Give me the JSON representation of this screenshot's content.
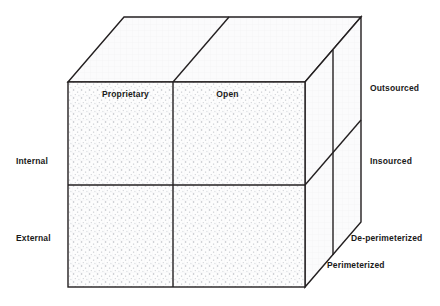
{
  "diagram": {
    "type": "3d-cube-model",
    "colors": {
      "stroke": "#231f20",
      "front_face_fill": "#fdfdfd",
      "top_face_fill": "#fbfbfb",
      "side_face_fill": "#fafafa",
      "stipple_dot": "#b9bcc2",
      "grid_line": "#ededf0",
      "label_text": "#1a1a1a",
      "page_background": "#ffffff"
    },
    "geometry": {
      "front_face": {
        "left": 68,
        "top": 82,
        "right": 305,
        "bottom": 287
      },
      "depth_offset": {
        "dx": 56,
        "dy": -65
      },
      "front_vertical_divider_x": 173,
      "front_horizontal_divider_y": 185,
      "side_vertical_divider_x": 333,
      "stroke_width": 1.4
    },
    "axes": {
      "x_axis": {
        "name": "technology-openness-axis",
        "labels": [
          "Proprietary",
          "Open"
        ]
      },
      "y_axis": {
        "name": "location-axis",
        "labels": [
          "Internal",
          "External"
        ]
      },
      "z_axis": {
        "name": "sourcing-and-perimeter-axis",
        "labels": [
          "Outsourced",
          "Insourced",
          "De-perimeterized",
          "Perimeterized"
        ]
      }
    },
    "faces": {
      "front": {
        "name": "front-face",
        "quadrants": [
          {
            "label": "Proprietary",
            "row": "Internal"
          },
          {
            "label": "Open",
            "row": "Internal"
          },
          {
            "label": "Proprietary",
            "row": "External"
          },
          {
            "label": "Open",
            "row": "External"
          }
        ]
      },
      "right": {
        "name": "right-side-face",
        "bands": [
          "Outsourced",
          "Insourced"
        ],
        "edge_labels": [
          "De-perimeterized",
          "Perimeterized"
        ]
      },
      "top": {
        "name": "top-face"
      }
    },
    "labels": {
      "proprietary": "Proprietary",
      "open": "Open",
      "internal": "Internal",
      "external": "External",
      "outsourced": "Outsourced",
      "insourced": "Insourced",
      "de_perimeterized": "De-perimeterized",
      "perimeterized": "Perimeterized"
    }
  }
}
